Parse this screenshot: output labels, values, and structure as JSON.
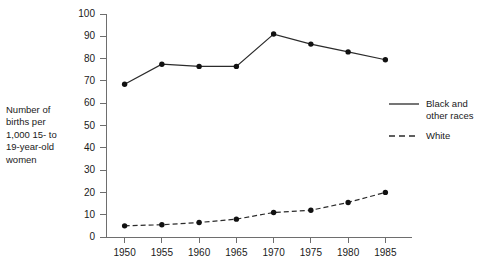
{
  "chart_data": {
    "type": "line",
    "title": "",
    "subtitle": "",
    "xlabel": "",
    "ylabel": "Number of births per 1,000 15- to 19-year-old women",
    "x": [
      1950,
      1955,
      1960,
      1965,
      1970,
      1975,
      1980,
      1985
    ],
    "xtick_labels": [
      "1950",
      "1955",
      "1960",
      "1965",
      "1970",
      "1975",
      "1980",
      "1985"
    ],
    "ytick_labels": [
      "0",
      "10",
      "20",
      "30",
      "40",
      "50",
      "60",
      "70",
      "80",
      "90",
      "100"
    ],
    "yticks": [
      0,
      10,
      20,
      30,
      40,
      50,
      60,
      70,
      80,
      90,
      100
    ],
    "xlim": [
      1947.5,
      1987.5
    ],
    "ylim": [
      0,
      100
    ],
    "grid": false,
    "legend_position": "right",
    "marker": "filled-circle",
    "series": [
      {
        "name": "Black and other races",
        "style": "solid",
        "color": "#2b2b2b",
        "values": [
          68.5,
          77.5,
          76.5,
          76.5,
          91.0,
          86.5,
          83.0,
          79.5
        ]
      },
      {
        "name": "White",
        "style": "dashed",
        "color": "#2b2b2b",
        "values": [
          5.0,
          5.5,
          6.5,
          8.0,
          11.0,
          12.0,
          15.5,
          20.0
        ]
      }
    ]
  },
  "axis": {
    "y_caption": "Number of\nbirths per\n1,000 15- to\n19-year-old\nwomen"
  },
  "legend": {
    "items": [
      {
        "label": "Black and\nother races",
        "style": "solid"
      },
      {
        "label": "White",
        "style": "dashed"
      }
    ]
  }
}
